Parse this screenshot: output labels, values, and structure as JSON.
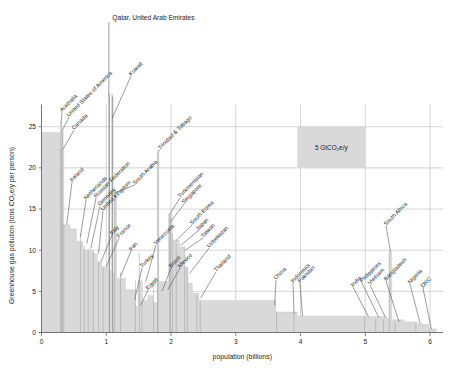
{
  "figure": {
    "background": "#ffffff",
    "bar_color": "#d9d9d9",
    "grid_color": "#b9b9b9",
    "axis_color": "#6a6a6a",
    "top_annotation": "Qatar, United Arab Emirates",
    "reference_box_label": "5 GtCO₂e/y"
  },
  "chart_data": {
    "type": "bar",
    "title": "",
    "xlabel": "population (billions)",
    "ylabel": "Greenhouse gas pollution (tons CO₂e/y per person)",
    "xlim": [
      0,
      6.2
    ],
    "ylim": [
      0,
      26
    ],
    "xticks": [
      "0",
      "1",
      "2",
      "3",
      "4",
      "5",
      "6"
    ],
    "xtick_values": [
      0,
      1,
      2,
      3,
      4,
      5,
      6
    ],
    "yticks": [
      "0",
      "5",
      "10",
      "15",
      "20",
      "25"
    ],
    "ytick_values": [
      0,
      5,
      10,
      15,
      20,
      25
    ],
    "grid": true,
    "legend_position": "none",
    "note": "Marimekko / width-weighted bar chart: each bar's width is a country's population (billions), height is per-capita greenhouse gas pollution (tons CO2e/y). Countries ordered from highest to lowest per-capita emissions.",
    "reference_area": {
      "label": "5 GtCO₂e/y",
      "x_start": 3.95,
      "x_end": 5.0,
      "y_start": 20.0,
      "y_end": 25.0,
      "meaning": "rectangle of area equal to 5 gigatons CO2e per year"
    },
    "bars": [
      {
        "name": "Qatar, United Arab Emirates",
        "x_start": 1.04,
        "width": 0.012,
        "value": 48.0,
        "labeled": true,
        "offscale": true
      },
      {
        "name": "unlabeled-top",
        "x_start": 0.0,
        "width": 0.3,
        "value": 24.3,
        "labeled": false
      },
      {
        "name": "Australia",
        "x_start": 0.3,
        "width": 0.025,
        "value": 25.6,
        "labeled": true
      },
      {
        "name": "United States of America",
        "x_start": 0.325,
        "width": 0.33,
        "value": 24.6,
        "labeled": true
      },
      {
        "name": "Canada",
        "x_start": 0.3,
        "width": 0.035,
        "value": 22.3,
        "labeled": true
      },
      {
        "name": "Kuwait",
        "x_start": 1.09,
        "width": 0.004,
        "value": 30.0,
        "labeled": true,
        "offscale": true
      },
      {
        "name": "Ireland",
        "x_start": 0.345,
        "width": 0.03,
        "value": 13.1,
        "labeled": true
      },
      {
        "name": "Netherlands",
        "x_start": 0.6,
        "width": 0.017,
        "value": 12.0,
        "labeled": true
      },
      {
        "name": "Russian Federation",
        "x_start": 0.66,
        "width": 0.145,
        "value": 10.6,
        "labeled": true
      },
      {
        "name": "Germany",
        "x_start": 0.72,
        "width": 0.083,
        "value": 10.2,
        "labeled": true
      },
      {
        "name": "United Kingdom",
        "x_start": 0.8,
        "width": 0.067,
        "value": 9.8,
        "labeled": true
      },
      {
        "name": "South Arabia",
        "x_start": 1.13,
        "width": 0.034,
        "value": 17.0,
        "labeled": true
      },
      {
        "name": "Italy",
        "x_start": 0.88,
        "width": 0.06,
        "value": 8.6,
        "labeled": true
      },
      {
        "name": "France",
        "x_start": 0.95,
        "width": 0.067,
        "value": 8.0,
        "labeled": true
      },
      {
        "name": "Iran",
        "x_start": 1.22,
        "width": 0.083,
        "value": 7.3,
        "labeled": true
      },
      {
        "name": "Turkey",
        "x_start": 1.45,
        "width": 0.084,
        "value": 6.3,
        "labeled": true
      },
      {
        "name": "Egypt",
        "x_start": 1.55,
        "width": 0.1,
        "value": 3.8,
        "labeled": true
      },
      {
        "name": "Venezuela",
        "x_start": 1.51,
        "width": 0.031,
        "value": 9.7,
        "labeled": true
      },
      {
        "name": "Trinidad & Tobago",
        "x_start": 1.8,
        "width": 0.003,
        "value": 22.0,
        "labeled": true
      },
      {
        "name": "Turkmenistan",
        "x_start": 1.98,
        "width": 0.006,
        "value": 14.4,
        "labeled": true
      },
      {
        "name": "Singapore",
        "x_start": 1.99,
        "width": 0.006,
        "value": 13.9,
        "labeled": true
      },
      {
        "name": "South Korea",
        "x_start": 2.02,
        "width": 0.052,
        "value": 12.0,
        "labeled": true
      },
      {
        "name": "Japan",
        "x_start": 2.08,
        "width": 0.126,
        "value": 10.8,
        "labeled": true
      },
      {
        "name": "Taiwan",
        "x_start": 2.21,
        "width": 0.024,
        "value": 10.5,
        "labeled": true
      },
      {
        "name": "Brazil",
        "x_start": 1.79,
        "width": 0.21,
        "value": 6.4,
        "labeled": true
      },
      {
        "name": "Mexico",
        "x_start": 1.73,
        "width": 0.128,
        "value": 5.4,
        "labeled": true
      },
      {
        "name": "Uzbekistan",
        "x_start": 2.25,
        "width": 0.034,
        "value": 7.8,
        "labeled": true
      },
      {
        "name": "Thailand",
        "x_start": 2.4,
        "width": 0.07,
        "value": 4.6,
        "labeled": true
      },
      {
        "name": "China",
        "x_start": 2.45,
        "width": 1.18,
        "value": 3.9,
        "labeled": true
      },
      {
        "name": "Indonesia",
        "x_start": 3.63,
        "width": 0.27,
        "value": 2.5,
        "labeled": true
      },
      {
        "name": "Pakistan",
        "x_start": 3.9,
        "width": 0.22,
        "value": 2.1,
        "labeled": true
      },
      {
        "name": "India",
        "x_start": 4.99,
        "width": 0.14,
        "value": 1.9,
        "labeled": true
      },
      {
        "name": "Philippines",
        "x_start": 5.16,
        "width": 0.11,
        "value": 1.7,
        "labeled": true
      },
      {
        "name": "Vietnam",
        "x_start": 5.28,
        "width": 0.1,
        "value": 1.6,
        "labeled": true
      },
      {
        "name": "South Africa",
        "x_start": 5.37,
        "width": 0.058,
        "value": 9.8,
        "labeled": true
      },
      {
        "name": "Bangladesh",
        "x_start": 5.46,
        "width": 0.17,
        "value": 1.3,
        "labeled": true
      },
      {
        "name": "Nigeria",
        "x_start": 5.78,
        "width": 0.21,
        "value": 1.0,
        "labeled": true
      },
      {
        "name": "DRC",
        "x_start": 5.99,
        "width": 0.09,
        "value": 0.35,
        "labeled": true
      }
    ],
    "profile_steps": [
      {
        "x": 0.0,
        "y": 24.3
      },
      {
        "x": 0.297,
        "y": 24.3
      },
      {
        "x": 0.297,
        "y": 25.6
      },
      {
        "x": 0.317,
        "y": 25.6
      },
      {
        "x": 0.317,
        "y": 24.5
      },
      {
        "x": 0.335,
        "y": 24.5
      },
      {
        "x": 0.335,
        "y": 22.3
      },
      {
        "x": 0.345,
        "y": 22.3
      },
      {
        "x": 0.345,
        "y": 13.1
      },
      {
        "x": 0.44,
        "y": 13.1
      },
      {
        "x": 0.44,
        "y": 12.6
      },
      {
        "x": 0.54,
        "y": 12.6
      },
      {
        "x": 0.54,
        "y": 11.1
      },
      {
        "x": 0.64,
        "y": 11.1
      },
      {
        "x": 0.64,
        "y": 10.0
      },
      {
        "x": 0.8,
        "y": 10.0
      },
      {
        "x": 0.8,
        "y": 9.6
      },
      {
        "x": 0.86,
        "y": 9.6
      },
      {
        "x": 0.86,
        "y": 8.6
      },
      {
        "x": 0.93,
        "y": 8.6
      },
      {
        "x": 0.93,
        "y": 8.0
      },
      {
        "x": 1.03,
        "y": 8.0
      },
      {
        "x": 1.03,
        "y": 48.0
      },
      {
        "x": 1.05,
        "y": 48.0
      },
      {
        "x": 1.05,
        "y": 7.6
      },
      {
        "x": 1.08,
        "y": 7.6
      },
      {
        "x": 1.08,
        "y": 30.0
      },
      {
        "x": 1.1,
        "y": 30.0
      },
      {
        "x": 1.1,
        "y": 7.2
      },
      {
        "x": 1.13,
        "y": 7.2
      },
      {
        "x": 1.13,
        "y": 17.0
      },
      {
        "x": 1.16,
        "y": 17.0
      },
      {
        "x": 1.16,
        "y": 6.6
      },
      {
        "x": 1.3,
        "y": 6.6
      },
      {
        "x": 1.3,
        "y": 5.2
      },
      {
        "x": 1.45,
        "y": 5.2
      },
      {
        "x": 1.45,
        "y": 3.2
      },
      {
        "x": 1.49,
        "y": 3.2
      },
      {
        "x": 1.49,
        "y": 6.3
      },
      {
        "x": 1.56,
        "y": 6.3
      },
      {
        "x": 1.56,
        "y": 3.9
      },
      {
        "x": 1.64,
        "y": 3.9
      },
      {
        "x": 1.64,
        "y": 4.5
      },
      {
        "x": 1.72,
        "y": 4.5
      },
      {
        "x": 1.72,
        "y": 3.6
      },
      {
        "x": 1.79,
        "y": 3.6
      },
      {
        "x": 1.79,
        "y": 22.0
      },
      {
        "x": 1.81,
        "y": 22.0
      },
      {
        "x": 1.81,
        "y": 6.2
      },
      {
        "x": 1.96,
        "y": 6.2
      },
      {
        "x": 1.96,
        "y": 14.4
      },
      {
        "x": 2.02,
        "y": 14.4
      },
      {
        "x": 2.02,
        "y": 11.2
      },
      {
        "x": 2.13,
        "y": 11.2
      },
      {
        "x": 2.13,
        "y": 10.4
      },
      {
        "x": 2.2,
        "y": 10.4
      },
      {
        "x": 2.2,
        "y": 8.0
      },
      {
        "x": 2.26,
        "y": 8.0
      },
      {
        "x": 2.26,
        "y": 6.0
      },
      {
        "x": 2.33,
        "y": 6.0
      },
      {
        "x": 2.33,
        "y": 4.8
      },
      {
        "x": 2.43,
        "y": 4.8
      },
      {
        "x": 2.43,
        "y": 3.9
      },
      {
        "x": 3.62,
        "y": 3.9
      },
      {
        "x": 3.62,
        "y": 2.5
      },
      {
        "x": 3.95,
        "y": 2.5
      },
      {
        "x": 3.95,
        "y": 2.0
      },
      {
        "x": 4.99,
        "y": 2.0
      },
      {
        "x": 4.99,
        "y": 1.95
      },
      {
        "x": 5.3,
        "y": 1.95
      },
      {
        "x": 5.3,
        "y": 1.7
      },
      {
        "x": 5.37,
        "y": 1.7
      },
      {
        "x": 5.37,
        "y": 9.8
      },
      {
        "x": 5.41,
        "y": 9.8
      },
      {
        "x": 5.41,
        "y": 1.55
      },
      {
        "x": 5.6,
        "y": 1.55
      },
      {
        "x": 5.6,
        "y": 1.3
      },
      {
        "x": 5.8,
        "y": 1.3
      },
      {
        "x": 5.8,
        "y": 1.0
      },
      {
        "x": 5.98,
        "y": 1.0
      },
      {
        "x": 5.98,
        "y": 0.45
      },
      {
        "x": 6.1,
        "y": 0.45
      }
    ]
  },
  "annotations": [
    {
      "id": "australia",
      "text": "Australia",
      "tip_x": 0.305,
      "tip_y": 25.6,
      "lx": 62,
      "ly": 112
    },
    {
      "id": "usa",
      "text": "United States of America",
      "tip_x": 0.325,
      "tip_y": 24.6,
      "lx": 69,
      "ly": 117
    },
    {
      "id": "canada",
      "text": "Canada",
      "tip_x": 0.336,
      "tip_y": 22.3,
      "lx": 74,
      "ly": 130
    },
    {
      "id": "kuwait",
      "text": "Kuwait",
      "tip_x": 1.09,
      "tip_y": 30.0,
      "lx": 131,
      "ly": 76
    },
    {
      "id": "ireland",
      "text": "Ireland",
      "tip_x": 0.39,
      "tip_y": 13.1,
      "lx": 72,
      "ly": 182
    },
    {
      "id": "netherlands",
      "text": "Netherlands",
      "tip_x": 0.6,
      "tip_y": 11.6,
      "lx": 86,
      "ly": 200
    },
    {
      "id": "russia",
      "text": "Russian Federation",
      "tip_x": 0.7,
      "tip_y": 10.8,
      "lx": 96,
      "ly": 198
    },
    {
      "id": "germany",
      "text": "Germany",
      "tip_x": 0.76,
      "tip_y": 10.2,
      "lx": 100,
      "ly": 206
    },
    {
      "id": "uk",
      "text": "United Kingdom",
      "tip_x": 0.88,
      "tip_y": 9.6,
      "lx": 103,
      "ly": 211
    },
    {
      "id": "saudi",
      "text": "South Arabia",
      "tip_x": 1.14,
      "tip_y": 17.0,
      "lx": 135,
      "ly": 185
    },
    {
      "id": "italy",
      "text": "Italy",
      "tip_x": 0.92,
      "tip_y": 8.6,
      "lx": 112,
      "ly": 235
    },
    {
      "id": "france",
      "text": "France",
      "tip_x": 1.0,
      "tip_y": 8.0,
      "lx": 119,
      "ly": 238
    },
    {
      "id": "iran",
      "text": "Iran",
      "tip_x": 1.22,
      "tip_y": 6.8,
      "lx": 131,
      "ly": 251
    },
    {
      "id": "turkey",
      "text": "Turkey",
      "tip_x": 1.44,
      "tip_y": 4.0,
      "lx": 142,
      "ly": 268
    },
    {
      "id": "egypt",
      "text": "Egypt",
      "tip_x": 1.53,
      "tip_y": 3.3,
      "lx": 148,
      "ly": 290
    },
    {
      "id": "venezuela",
      "text": "Venezuela",
      "tip_x": 1.61,
      "tip_y": 6.2,
      "lx": 156,
      "ly": 245
    },
    {
      "id": "trinidad",
      "text": "Trinidad & Tobago",
      "tip_x": 1.8,
      "tip_y": 22.0,
      "lx": 160,
      "ly": 150
    },
    {
      "id": "turkmenistan",
      "text": "Turkmenistan",
      "tip_x": 1.98,
      "tip_y": 14.4,
      "lx": 180,
      "ly": 198
    },
    {
      "id": "singapore",
      "text": "Singapore",
      "tip_x": 2.0,
      "tip_y": 13.5,
      "lx": 184,
      "ly": 204
    },
    {
      "id": "southkorea",
      "text": "South Korea",
      "tip_x": 2.08,
      "tip_y": 11.2,
      "lx": 192,
      "ly": 225
    },
    {
      "id": "japan",
      "text": "Japan",
      "tip_x": 2.15,
      "tip_y": 10.6,
      "lx": 198,
      "ly": 231
    },
    {
      "id": "taiwan",
      "text": "Taiwan",
      "tip_x": 2.22,
      "tip_y": 10.0,
      "lx": 203,
      "ly": 238
    },
    {
      "id": "brazil",
      "text": "Brazil",
      "tip_x": 1.86,
      "tip_y": 5.0,
      "lx": 171,
      "ly": 268
    },
    {
      "id": "mexico",
      "text": "Mexico",
      "tip_x": 1.95,
      "tip_y": 5.2,
      "lx": 180,
      "ly": 268
    },
    {
      "id": "uzbekistan",
      "text": "Uzbekistan",
      "tip_x": 2.29,
      "tip_y": 7.2,
      "lx": 209,
      "ly": 248
    },
    {
      "id": "thailand",
      "text": "Thailand",
      "tip_x": 2.46,
      "tip_y": 4.2,
      "lx": 216,
      "ly": 272
    },
    {
      "id": "china",
      "text": "China",
      "tip_x": 3.6,
      "tip_y": 3.3,
      "lx": 276,
      "ly": 280
    },
    {
      "id": "indonesia",
      "text": "Indonesia",
      "tip_x": 3.9,
      "tip_y": 2.2,
      "lx": 293,
      "ly": 283
    },
    {
      "id": "pakistan",
      "text": "Pakistan",
      "tip_x": 4.03,
      "tip_y": 2.0,
      "lx": 300,
      "ly": 283
    },
    {
      "id": "india",
      "text": "India",
      "tip_x": 5.05,
      "tip_y": 1.9,
      "lx": 353,
      "ly": 287
    },
    {
      "id": "philippines",
      "text": "Philippines",
      "tip_x": 5.21,
      "tip_y": 1.8,
      "lx": 362,
      "ly": 283
    },
    {
      "id": "vietnam",
      "text": "Vietnam",
      "tip_x": 5.32,
      "tip_y": 1.7,
      "lx": 370,
      "ly": 285
    },
    {
      "id": "southafrica",
      "text": "South Africa",
      "tip_x": 5.39,
      "tip_y": 9.8,
      "lx": 386,
      "ly": 226
    },
    {
      "id": "bangladesh",
      "text": "Bangladesh",
      "tip_x": 5.52,
      "tip_y": 1.3,
      "lx": 386,
      "ly": 281
    },
    {
      "id": "nigeria",
      "text": "Nigeria",
      "tip_x": 5.85,
      "tip_y": 1.0,
      "lx": 410,
      "ly": 284
    },
    {
      "id": "drc",
      "text": "DRC",
      "tip_x": 6.02,
      "tip_y": 0.4,
      "lx": 423,
      "ly": 288
    }
  ]
}
